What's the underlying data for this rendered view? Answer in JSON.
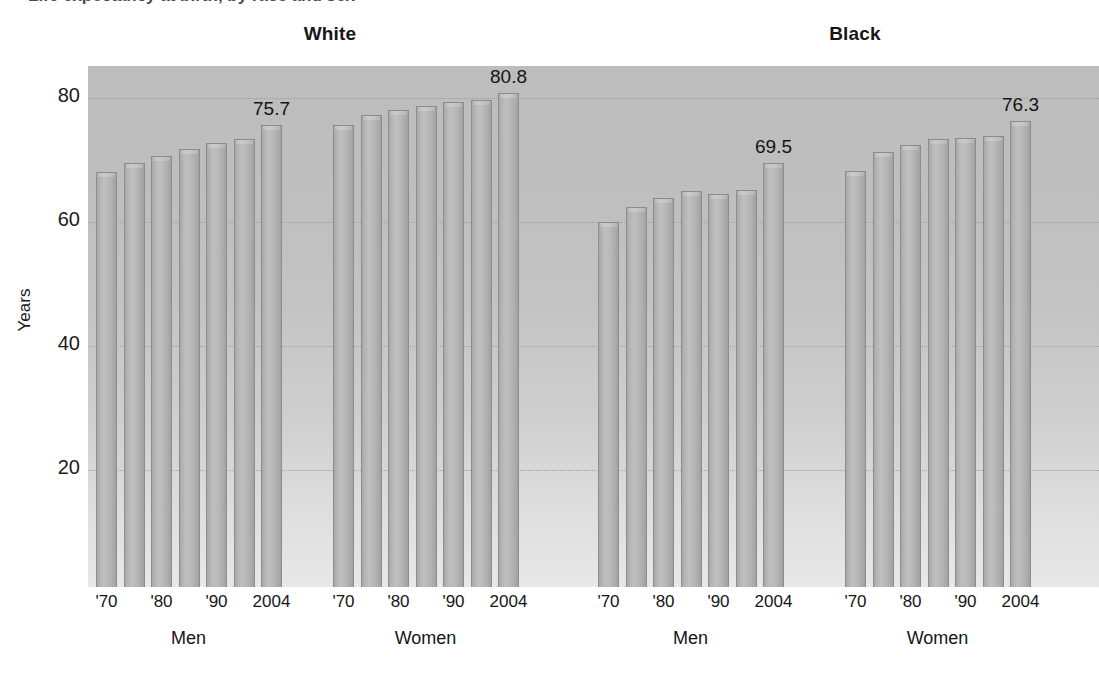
{
  "figure": {
    "y_axis_title": "Years",
    "section_titles": [
      "White",
      "Black"
    ],
    "group_labels": [
      "Men",
      "Women",
      "Men",
      "Women"
    ],
    "y_tick_labels": [
      "80",
      "60",
      "40",
      "20"
    ],
    "x_tick_labels": [
      "'70",
      "'80",
      "'90",
      "2004"
    ],
    "bar_value_labels": [
      "75.7",
      "80.8",
      "69.5",
      "76.3"
    ],
    "colors": {
      "plot_background_top": "#bdbdbd",
      "plot_background_bottom": "#e8e8e8",
      "bar_fill": "#b4b4b4",
      "bar_stroke": "#8c8c8c",
      "gridline": "#9a9a9a",
      "text": "#161616",
      "page_background": "#ffffff"
    }
  },
  "chart_data": {
    "type": "bar",
    "title": "Life expectancy at birth, by race and sex",
    "xlabel": "",
    "ylabel": "Years",
    "ylim": [
      0,
      86
    ],
    "yticks": [
      20,
      40,
      60,
      80
    ],
    "grid": true,
    "legend": "none",
    "x": [
      "1970",
      "1975",
      "1980",
      "1985",
      "1990",
      "1995",
      "2004"
    ],
    "x_tick_labels_shown": [
      "'70",
      "'80",
      "'90",
      "2004"
    ],
    "panels": [
      {
        "panel": "White",
        "groups": [
          {
            "name": "Men",
            "categories": [
              "1970",
              "1975",
              "1980",
              "1985",
              "1990",
              "1995",
              "2004"
            ],
            "values": [
              68.0,
              69.5,
              70.7,
              71.8,
              72.7,
              73.4,
              75.7
            ],
            "labeled_value": "75.7"
          },
          {
            "name": "Women",
            "categories": [
              "1970",
              "1975",
              "1980",
              "1985",
              "1990",
              "1995",
              "2004"
            ],
            "values": [
              75.6,
              77.3,
              78.1,
              78.7,
              79.4,
              79.6,
              80.8
            ],
            "labeled_value": "80.8"
          }
        ]
      },
      {
        "panel": "Black",
        "groups": [
          {
            "name": "Men",
            "categories": [
              "1970",
              "1975",
              "1980",
              "1985",
              "1990",
              "1995",
              "2004"
            ],
            "values": [
              60.0,
              62.4,
              63.8,
              65.0,
              64.5,
              65.2,
              69.5
            ],
            "labeled_value": "69.5"
          },
          {
            "name": "Women",
            "categories": [
              "1970",
              "1975",
              "1980",
              "1985",
              "1990",
              "1995",
              "2004"
            ],
            "values": [
              68.3,
              71.3,
              72.5,
              73.4,
              73.6,
              73.9,
              76.3
            ],
            "labeled_value": "76.3"
          }
        ]
      }
    ]
  }
}
